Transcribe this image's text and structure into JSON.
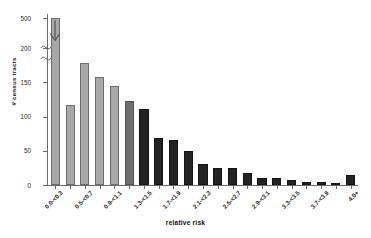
{
  "chart_data": {
    "type": "bar",
    "title": "",
    "xlabel": "relative risk",
    "ylabel": "# census tracts",
    "ylim": [
      0,
      200
    ],
    "y_broken_axis": true,
    "y_break_between": [
      200,
      500
    ],
    "yticks": [
      "0",
      "50",
      "100",
      "150",
      "200",
      "500"
    ],
    "grid": false,
    "legend": "none",
    "categories": [
      "0.0-<0.3",
      "0.3-<0.5",
      "0.5-<0.7",
      "0.7-<0.9",
      "0.9-<1.1",
      "1.1-<1.3",
      "1.3-<1.5",
      "1.5-<1.7",
      "1.7-<1.9",
      "1.9-<2.1",
      "2.1-<2.3",
      "2.3-<2.5",
      "2.5-<2.7",
      "2.7-<2.9",
      "2.9-<3.1",
      "3.1-<3.3",
      "3.3-<3.5",
      "3.5-<3.7",
      "3.7-<3.9",
      "3.9-<4.0",
      "4.0+"
    ],
    "tick_labels_shown": [
      "0.0-<0.3",
      "0.5-<0.7",
      "0.9-<1.1",
      "1.3-<1.5",
      "1.7-<1.9",
      "2.1-<2.3",
      "2.5-<2.7",
      "2.9-<3.1",
      "3.3-<3.5",
      "3.7-<3.9",
      "4.0+"
    ],
    "values": [
      530,
      117,
      178,
      157,
      144,
      123,
      111,
      68,
      65,
      49,
      31,
      25,
      25,
      18,
      10,
      10,
      8,
      5,
      4,
      3,
      14
    ],
    "bar_shades": [
      "light",
      "light",
      "light",
      "light",
      "light",
      "medium",
      "dark",
      "dark",
      "dark",
      "dark",
      "dark",
      "dark",
      "dark",
      "dark",
      "dark",
      "dark",
      "dark",
      "dark",
      "dark",
      "dark",
      "dark"
    ],
    "colors": {
      "light": "#a8a8a8",
      "medium": "#6e6e6e",
      "dark": "#232323",
      "axis": "#6b6b6b",
      "text": "#1a1a1a",
      "background": "#ffffff"
    }
  }
}
